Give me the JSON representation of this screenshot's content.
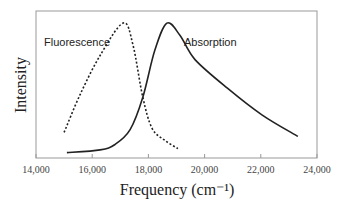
{
  "chart_data": {
    "type": "line",
    "title": "",
    "xlabel": "Frequency (cm⁻¹)",
    "ylabel": "Intensity",
    "xlim": [
      14000,
      24000
    ],
    "ylim": [
      0,
      1.09
    ],
    "xticks": [
      14000,
      16000,
      18000,
      20000,
      22000,
      24000
    ],
    "xtick_labels": [
      "14,000",
      "16,000",
      "18,000",
      "20,000",
      "22,000",
      "24,000"
    ],
    "yticks": [],
    "grid": false,
    "legend": "none (inline labels)",
    "series": [
      {
        "name": "Fluorescence",
        "style": "dotted",
        "color": "#222222",
        "x": [
          15000,
          15570,
          16280,
          17100,
          17450,
          17800,
          18130,
          18590,
          19050
        ],
        "y": [
          0.19,
          0.47,
          0.76,
          1.0,
          0.84,
          0.45,
          0.22,
          0.13,
          0.07
        ]
      },
      {
        "name": "Absorption",
        "style": "solid",
        "color": "#222222",
        "x": [
          15100,
          16280,
          16810,
          17350,
          17800,
          18230,
          18660,
          19120,
          19660,
          20800,
          22040,
          23320
        ],
        "y": [
          0.04,
          0.06,
          0.1,
          0.21,
          0.45,
          0.8,
          1.0,
          0.91,
          0.73,
          0.52,
          0.32,
          0.16
        ]
      }
    ],
    "annotations": [
      {
        "text": "Fluorescence",
        "near_x": 16000
      },
      {
        "text": "Absorption",
        "near_x": 19800
      }
    ]
  },
  "labels": {
    "fluorescence": "Fluorescence",
    "absorption": "Absorption",
    "xlabel": "Frequency (cm⁻¹)",
    "ylabel": "Intensity"
  }
}
